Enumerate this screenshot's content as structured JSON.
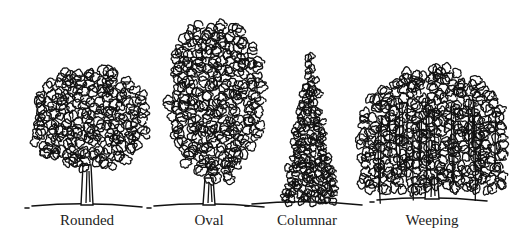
{
  "figure": {
    "background": "#ffffff",
    "ink_color": "#111111",
    "trees": [
      {
        "id": "rounded",
        "label": "Rounded",
        "center_x": 87,
        "canopy": {
          "shape": "round",
          "x": 30,
          "y": 65,
          "w": 118,
          "h": 108
        },
        "trunk_top": 165,
        "ground_y": 205
      },
      {
        "id": "oval",
        "label": "Oval",
        "center_x": 209,
        "canopy": {
          "shape": "oval",
          "x": 168,
          "y": 12,
          "w": 95,
          "h": 170
        },
        "trunk_top": 178,
        "ground_y": 205
      },
      {
        "id": "columnar",
        "label": "Columnar",
        "center_x": 307,
        "canopy": {
          "shape": "columnar",
          "x": 284,
          "y": 55,
          "w": 52,
          "h": 148
        },
        "trunk_top": 203,
        "ground_y": 203
      },
      {
        "id": "weeping",
        "label": "Weeping",
        "center_x": 432,
        "canopy": {
          "shape": "weeping",
          "x": 360,
          "y": 68,
          "w": 146,
          "h": 122
        },
        "trunk_top": 170,
        "ground_y": 199
      }
    ]
  }
}
